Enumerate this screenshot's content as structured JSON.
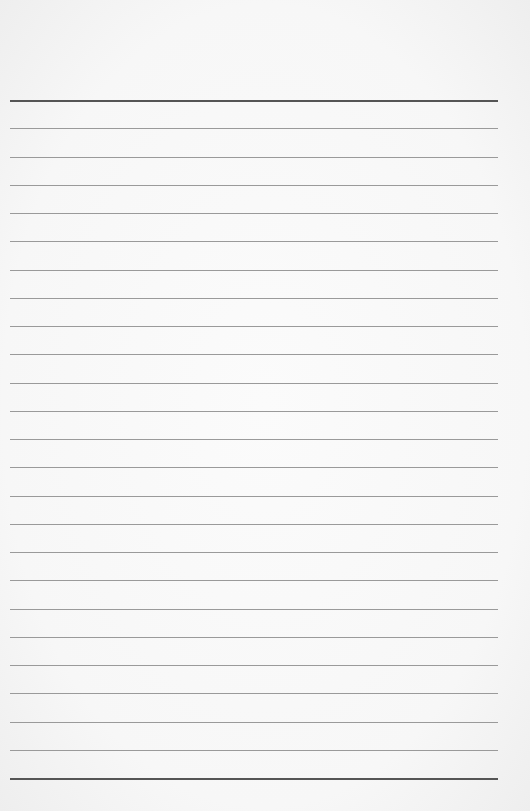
{
  "page": {
    "type": "lined-paper",
    "background_color": "#f8f8f8",
    "rule_color": "#9a9a9a",
    "heavy_rule_color": "#555555",
    "rule_count": 25,
    "first_rule_y": 100,
    "rule_spacing": 28.25,
    "rule_left": 10,
    "rule_right": 498
  }
}
